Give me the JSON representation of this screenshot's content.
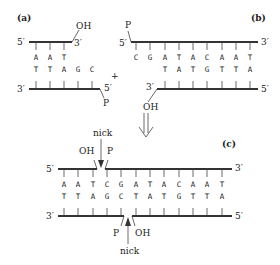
{
  "panels": {
    "a": {
      "label": "(a)",
      "top_strand": {
        "left_end": "5′",
        "right_end": "3′",
        "terminal_group": "OH",
        "bases": [
          "A",
          "A",
          "T"
        ]
      },
      "bottom_strand": {
        "left_end": "3′",
        "right_end": "5′",
        "terminal_group": "P",
        "bases": [
          "T",
          "T",
          "A",
          "G",
          "C"
        ]
      }
    },
    "plus": "+",
    "b": {
      "label": "(b)",
      "top_strand": {
        "left_end": "5′",
        "right_end": "3′",
        "terminal_group": "P",
        "bases": [
          "C",
          "G",
          "A",
          "T",
          "A",
          "C",
          "A",
          "A",
          "T"
        ]
      },
      "bottom_strand": {
        "left_end": "3′",
        "right_end": "5′",
        "terminal_group": "OH",
        "bases": [
          "T",
          "A",
          "T",
          "G",
          "T",
          "T",
          "A"
        ]
      }
    },
    "arrow": "⇓",
    "c": {
      "label": "(c)",
      "top_strand": {
        "left_end": "5′",
        "right_end": "3′",
        "bases": [
          "A",
          "A",
          "T",
          "C",
          "G",
          "A",
          "T",
          "A",
          "C",
          "A",
          "A",
          "T"
        ]
      },
      "bottom_strand": {
        "left_end": "3′",
        "right_end": "5′",
        "bases": [
          "T",
          "T",
          "A",
          "G",
          "C",
          "T",
          "A",
          "T",
          "G",
          "T",
          "T",
          "A"
        ]
      },
      "top_nick": {
        "label": "nick",
        "left_group": "OH",
        "right_group": "P"
      },
      "bottom_nick": {
        "label": "nick",
        "left_group": "P",
        "right_group": "OH"
      }
    }
  }
}
